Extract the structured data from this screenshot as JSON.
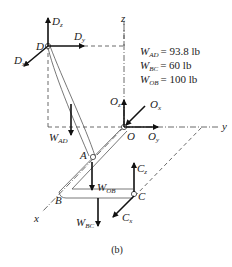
{
  "figure": {
    "caption": "(b)",
    "axes": {
      "x": "x",
      "y": "y",
      "z": "z"
    },
    "points": {
      "D": "D",
      "O": "O",
      "A": "A",
      "B": "B",
      "C": "C"
    },
    "forces": {
      "Dz": {
        "main": "D",
        "sub": "z"
      },
      "Dy": {
        "main": "D",
        "sub": "y"
      },
      "Dx": {
        "main": "D",
        "sub": "x"
      },
      "Oz": {
        "main": "O",
        "sub": "z"
      },
      "Ox": {
        "main": "O",
        "sub": "x"
      },
      "Oy": {
        "main": "O",
        "sub": "y"
      },
      "Cz": {
        "main": "C",
        "sub": "z"
      },
      "Cx": {
        "main": "C",
        "sub": "x"
      },
      "WAD": {
        "main": "W",
        "sub": "AD"
      },
      "WOB": {
        "main": "W",
        "sub": "OB"
      },
      "WBC": {
        "main": "W",
        "sub": "BC"
      }
    },
    "weights": [
      {
        "main": "W",
        "sub": "AD",
        "value": "= 93.8 lb"
      },
      {
        "main": "W",
        "sub": "BC",
        "value": "= 60 lb"
      },
      {
        "main": "W",
        "sub": "OB",
        "value": "= 100 lb"
      }
    ]
  }
}
